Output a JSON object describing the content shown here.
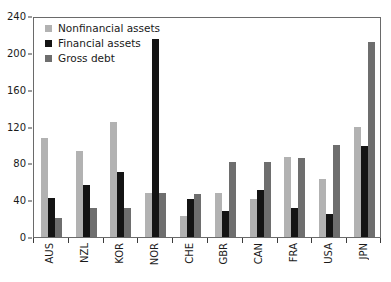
{
  "chart_data": {
    "type": "bar",
    "title": "",
    "xlabel": "",
    "ylabel": "",
    "ylim": [
      0,
      240
    ],
    "yticks": [
      0,
      40,
      80,
      120,
      160,
      200,
      240
    ],
    "grid": false,
    "legend_position": "top-left",
    "categories": [
      "AUS",
      "NZL",
      "KOR",
      "NOR",
      "CHE",
      "GBR",
      "CAN",
      "FRA",
      "USA",
      "JPN"
    ],
    "series": [
      {
        "name": "Nonfinancial assets",
        "color": "#b2b2b2",
        "values": [
          108,
          93,
          125,
          48,
          23,
          48,
          41,
          87,
          63,
          119
        ]
      },
      {
        "name": "Financial assets",
        "color": "#141414",
        "values": [
          42,
          57,
          71,
          215,
          41,
          28,
          51,
          32,
          25,
          99
        ]
      },
      {
        "name": "Gross debt",
        "color": "#6e6e6e",
        "values": [
          21,
          31,
          31,
          48,
          47,
          81,
          81,
          86,
          100,
          212
        ]
      }
    ]
  },
  "legend": {
    "items": [
      {
        "label": "Nonfinancial assets",
        "color": "#b2b2b2"
      },
      {
        "label": "Financial assets",
        "color": "#141414"
      },
      {
        "label": "Gross debt",
        "color": "#6e6e6e"
      }
    ]
  }
}
